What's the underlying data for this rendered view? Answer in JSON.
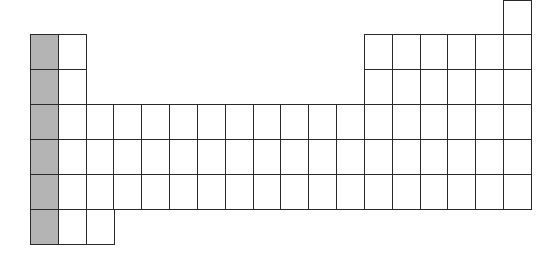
{
  "diagram": {
    "title": "",
    "colors": {
      "border": "#2a2a2a",
      "empty": "#ffffff",
      "shaded": "#b4b4b4"
    },
    "layout": {
      "origin_x": 30,
      "origin_y": 34,
      "cell_w": 27.83,
      "cell_h": 35,
      "columns": 18
    },
    "shaded_column": 1,
    "cells": [
      {
        "row": 0,
        "col": 18
      },
      {
        "row": 1,
        "col": 1
      },
      {
        "row": 1,
        "col": 2
      },
      {
        "row": 1,
        "col": 13
      },
      {
        "row": 1,
        "col": 14
      },
      {
        "row": 1,
        "col": 15
      },
      {
        "row": 1,
        "col": 16
      },
      {
        "row": 1,
        "col": 17
      },
      {
        "row": 1,
        "col": 18
      },
      {
        "row": 2,
        "col": 1
      },
      {
        "row": 2,
        "col": 2
      },
      {
        "row": 2,
        "col": 13
      },
      {
        "row": 2,
        "col": 14
      },
      {
        "row": 2,
        "col": 15
      },
      {
        "row": 2,
        "col": 16
      },
      {
        "row": 2,
        "col": 17
      },
      {
        "row": 2,
        "col": 18
      },
      {
        "row": 3,
        "col": 1
      },
      {
        "row": 3,
        "col": 2
      },
      {
        "row": 3,
        "col": 3
      },
      {
        "row": 3,
        "col": 4
      },
      {
        "row": 3,
        "col": 5
      },
      {
        "row": 3,
        "col": 6
      },
      {
        "row": 3,
        "col": 7
      },
      {
        "row": 3,
        "col": 8
      },
      {
        "row": 3,
        "col": 9
      },
      {
        "row": 3,
        "col": 10
      },
      {
        "row": 3,
        "col": 11
      },
      {
        "row": 3,
        "col": 12
      },
      {
        "row": 3,
        "col": 13
      },
      {
        "row": 3,
        "col": 14
      },
      {
        "row": 3,
        "col": 15
      },
      {
        "row": 3,
        "col": 16
      },
      {
        "row": 3,
        "col": 17
      },
      {
        "row": 3,
        "col": 18
      },
      {
        "row": 4,
        "col": 1
      },
      {
        "row": 4,
        "col": 2
      },
      {
        "row": 4,
        "col": 3
      },
      {
        "row": 4,
        "col": 4
      },
      {
        "row": 4,
        "col": 5
      },
      {
        "row": 4,
        "col": 6
      },
      {
        "row": 4,
        "col": 7
      },
      {
        "row": 4,
        "col": 8
      },
      {
        "row": 4,
        "col": 9
      },
      {
        "row": 4,
        "col": 10
      },
      {
        "row": 4,
        "col": 11
      },
      {
        "row": 4,
        "col": 12
      },
      {
        "row": 4,
        "col": 13
      },
      {
        "row": 4,
        "col": 14
      },
      {
        "row": 4,
        "col": 15
      },
      {
        "row": 4,
        "col": 16
      },
      {
        "row": 4,
        "col": 17
      },
      {
        "row": 4,
        "col": 18
      },
      {
        "row": 5,
        "col": 1
      },
      {
        "row": 5,
        "col": 2
      },
      {
        "row": 5,
        "col": 3
      },
      {
        "row": 5,
        "col": 4
      },
      {
        "row": 5,
        "col": 5
      },
      {
        "row": 5,
        "col": 6
      },
      {
        "row": 5,
        "col": 7
      },
      {
        "row": 5,
        "col": 8
      },
      {
        "row": 5,
        "col": 9
      },
      {
        "row": 5,
        "col": 10
      },
      {
        "row": 5,
        "col": 11
      },
      {
        "row": 5,
        "col": 12
      },
      {
        "row": 5,
        "col": 13
      },
      {
        "row": 5,
        "col": 14
      },
      {
        "row": 5,
        "col": 15
      },
      {
        "row": 5,
        "col": 16
      },
      {
        "row": 5,
        "col": 17
      },
      {
        "row": 5,
        "col": 18
      },
      {
        "row": 6,
        "col": 1
      },
      {
        "row": 6,
        "col": 2
      },
      {
        "row": 6,
        "col": 3
      }
    ]
  }
}
